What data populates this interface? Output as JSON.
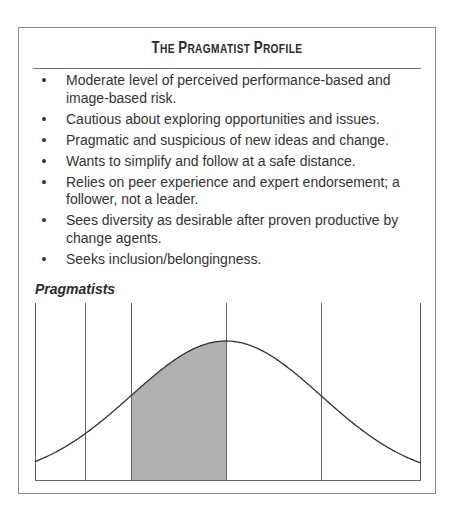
{
  "box": {
    "title_parts": [
      "T",
      "HE ",
      "P",
      "RAGMATIST ",
      "P",
      "ROFILE"
    ],
    "title": "The Pragmatist Profile",
    "items": [
      {
        "bullet": "•",
        "text": "Moderate level of perceived performance-based and image-based risk."
      },
      {
        "bullet": "•",
        "text": "Cautious about exploring opportunities and issues."
      },
      {
        "bullet": "•",
        "text": "Pragmatic and suspicious of new ideas and change."
      },
      {
        "bullet": "•",
        "text": "Wants to simplify and follow at a safe distance."
      },
      {
        "bullet": "•",
        "text": "Relies on peer experience and expert endorsement; a follower, not a leader."
      },
      {
        "bullet": "•",
        "text": "Sees diversity as desirable after proven productive by change agents."
      },
      {
        "bullet": "•",
        "text": "Seeks inclusion/belongingness."
      }
    ],
    "subheading": "Pragmatists"
  },
  "chart_data": {
    "type": "area",
    "title": "Pragmatists",
    "x_boundaries_sd": [
      -3,
      -2,
      -1,
      0,
      1,
      3
    ],
    "shaded_range_sd": [
      -1,
      0
    ],
    "colors": {
      "shade": "#b0b0b0",
      "line": "#333333",
      "grid": "#666666"
    },
    "grid": false,
    "legend": null
  }
}
